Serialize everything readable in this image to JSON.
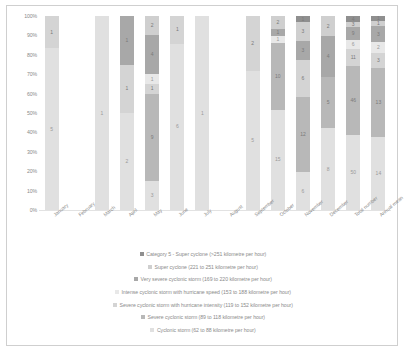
{
  "chart_data": {
    "type": "bar",
    "subtype": "stacked-100-percent",
    "title": "",
    "xlabel": "",
    "ylabel": "",
    "ylim": [
      0,
      100
    ],
    "ytick_labels": [
      "100%",
      "90%",
      "80%",
      "70%",
      "60%",
      "50%",
      "40%",
      "30%",
      "20%",
      "10%",
      "0%"
    ],
    "grid": false,
    "legend_position": "bottom",
    "categories": [
      "January",
      "February",
      "March",
      "April",
      "May",
      "June",
      "July",
      "August",
      "September",
      "October",
      "November",
      "December",
      "Total number",
      "Annual mean"
    ],
    "series": [
      {
        "name": "Category 5 - Super cyclone (>251 kilometre per hour)",
        "color": "#8f8f8f",
        "values": [
          0,
          0,
          0,
          0,
          0,
          0,
          0,
          0,
          0,
          0,
          1,
          0,
          4,
          1
        ]
      },
      {
        "name": "Super cyclone (221 to 251 kilometre per hour)",
        "color": "#cfcfcf",
        "values": [
          0,
          0,
          0,
          0,
          2,
          0,
          0,
          0,
          0,
          2,
          3,
          0,
          3,
          1
        ]
      },
      {
        "name": "Very severe cyclonic storm (169 to 220 kilometre per hour)",
        "color": "#a8a8a8",
        "values": [
          0,
          0,
          0,
          1,
          4,
          0,
          0,
          0,
          0,
          1,
          3,
          2,
          9,
          3
        ]
      },
      {
        "name": "Intense cyclonic storm with hurricane speed (153 to 188 kilometre per hour)",
        "color": "#e8e8e8",
        "values": [
          0,
          0,
          0,
          0,
          1,
          0,
          0,
          0,
          0,
          1,
          0,
          0,
          6,
          2
        ]
      },
      {
        "name": "Severe cyclonic storm with hurricane intensity (119 to 152 kilometre per hour)",
        "color": "#d4d4d4",
        "values": [
          1,
          0,
          0,
          1,
          1,
          1,
          0,
          0,
          2,
          0,
          6,
          4,
          11,
          3
        ]
      },
      {
        "name": "Severe cyclonic storm (89 to 118 kilometre per hour)",
        "color": "#b8b8b8",
        "values": [
          0,
          0,
          0,
          0,
          9,
          0,
          0,
          0,
          0,
          10,
          12,
          5,
          46,
          13
        ]
      },
      {
        "name": "Cyclonic storm (62 to 88 kilometre per hour)",
        "color": "#e0e0e0",
        "values": [
          5,
          0,
          1,
          2,
          3,
          6,
          1,
          0,
          5,
          15,
          6,
          8,
          50,
          14
        ]
      }
    ],
    "stacks": [
      {
        "category": "January",
        "segments": [
          {
            "value": 1,
            "series": 4
          },
          {
            "value": 5,
            "series": 6
          }
        ]
      },
      {
        "category": "February",
        "segments": []
      },
      {
        "category": "March",
        "segments": [
          {
            "value": 1,
            "series": 6
          }
        ]
      },
      {
        "category": "April",
        "segments": [
          {
            "value": 1,
            "series": 2
          },
          {
            "value": 1,
            "series": 4
          },
          {
            "value": 2,
            "series": 6
          }
        ]
      },
      {
        "category": "May",
        "segments": [
          {
            "value": 2,
            "series": 1
          },
          {
            "value": 4,
            "series": 2
          },
          {
            "value": 1,
            "series": 3
          },
          {
            "value": 1,
            "series": 4
          },
          {
            "value": 9,
            "series": 5
          },
          {
            "value": 3,
            "series": 6
          }
        ]
      },
      {
        "category": "June",
        "segments": [
          {
            "value": 1,
            "series": 4
          },
          {
            "value": 6,
            "series": 6
          }
        ]
      },
      {
        "category": "July",
        "segments": [
          {
            "value": 1,
            "series": 6
          }
        ]
      },
      {
        "category": "August",
        "segments": []
      },
      {
        "category": "September",
        "segments": [
          {
            "value": 2,
            "series": 4
          },
          {
            "value": 5,
            "series": 6
          }
        ]
      },
      {
        "category": "October",
        "segments": [
          {
            "value": 2,
            "series": 1
          },
          {
            "value": 1,
            "series": 2
          },
          {
            "value": 1,
            "series": 3
          },
          {
            "value": 10,
            "series": 5
          },
          {
            "value": 15,
            "series": 6
          }
        ]
      },
      {
        "category": "November",
        "segments": [
          {
            "value": 1,
            "series": 0
          },
          {
            "value": 3,
            "series": 1
          },
          {
            "value": 3,
            "series": 2
          },
          {
            "value": 6,
            "series": 4
          },
          {
            "value": 12,
            "series": 5
          },
          {
            "value": 6,
            "series": 6
          }
        ]
      },
      {
        "category": "December",
        "segments": [
          {
            "value": 0,
            "series": 0
          },
          {
            "value": 2,
            "series": 1
          },
          {
            "value": 4,
            "series": 2
          },
          {
            "value": 5,
            "series": 5
          },
          {
            "value": 8,
            "series": 6
          }
        ]
      },
      {
        "category": "Total number",
        "segments": [
          {
            "value": 4,
            "series": 0
          },
          {
            "value": 3,
            "series": 1
          },
          {
            "value": 9,
            "series": 2
          },
          {
            "value": 6,
            "series": 3
          },
          {
            "value": 11,
            "series": 4
          },
          {
            "value": 46,
            "series": 5
          },
          {
            "value": 50,
            "series": 6
          }
        ]
      },
      {
        "category": "Annual mean",
        "segments": [
          {
            "value": 1,
            "series": 0
          },
          {
            "value": 1,
            "series": 1
          },
          {
            "value": 3,
            "series": 2
          },
          {
            "value": 2,
            "series": 3
          },
          {
            "value": 3,
            "series": 4
          },
          {
            "value": 13,
            "series": 5
          },
          {
            "value": 14,
            "series": 6
          }
        ]
      }
    ]
  }
}
